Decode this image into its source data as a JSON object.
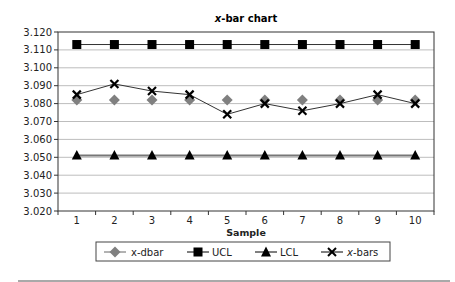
{
  "chart_data": {
    "type": "line",
    "title": "x-bar chart",
    "title_italic_prefix": "x",
    "title_rest": "-bar chart",
    "xlabel": "Sample",
    "ylabel": "",
    "x": [
      1,
      2,
      3,
      4,
      5,
      6,
      7,
      8,
      9,
      10
    ],
    "ylim": [
      3.02,
      3.12
    ],
    "yticks": [
      "3.120",
      "3.110",
      "3.100",
      "3.090",
      "3.080",
      "3.070",
      "3.060",
      "3.050",
      "3.040",
      "3.030",
      "3.020"
    ],
    "grid": true,
    "legend_position": "bottom",
    "series": [
      {
        "name": "x-dbar",
        "marker": "diamond",
        "color": "#808080",
        "line": false,
        "values": [
          3.082,
          3.082,
          3.082,
          3.082,
          3.082,
          3.082,
          3.082,
          3.082,
          3.082,
          3.082
        ]
      },
      {
        "name": "UCL",
        "marker": "square",
        "color": "#000000",
        "line": true,
        "values": [
          3.113,
          3.113,
          3.113,
          3.113,
          3.113,
          3.113,
          3.113,
          3.113,
          3.113,
          3.113
        ]
      },
      {
        "name": "LCL",
        "marker": "triangle",
        "color": "#000000",
        "line": true,
        "values": [
          3.051,
          3.051,
          3.051,
          3.051,
          3.051,
          3.051,
          3.051,
          3.051,
          3.051,
          3.051
        ]
      },
      {
        "name": "x-bars",
        "marker": "x",
        "color": "#000000",
        "line": true,
        "values": [
          3.085,
          3.091,
          3.087,
          3.085,
          3.074,
          3.08,
          3.076,
          3.08,
          3.085,
          3.08
        ]
      }
    ]
  },
  "legend": {
    "items": [
      {
        "label": "x-dbar",
        "italic_prefix": ""
      },
      {
        "label": "UCL",
        "italic_prefix": ""
      },
      {
        "label": "LCL",
        "italic_prefix": ""
      },
      {
        "label": "-bars",
        "italic_prefix": "x"
      }
    ]
  }
}
